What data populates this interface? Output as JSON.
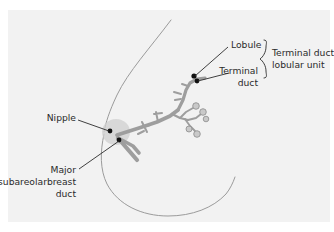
{
  "figure": {
    "background_color": "#f2f2f2",
    "page_color": "#ffffff",
    "duct_color": "#9e9e9e",
    "contour_color": "#9b9b9b",
    "marker_color": "#111111",
    "text_color": "#2b2b2b",
    "areola_color": "#cfcfcf"
  },
  "labels": {
    "lobule": "Lobule",
    "terminal_duct_line1": "Terminal",
    "terminal_duct_line2": "duct",
    "tdlu_line1": "Terminal duct",
    "tdlu_line2": "lobular unit",
    "nipple": "Nipple",
    "major_duct_line1": "Major",
    "major_duct_line2": "subareolarbreast",
    "major_duct_line3": "duct"
  }
}
